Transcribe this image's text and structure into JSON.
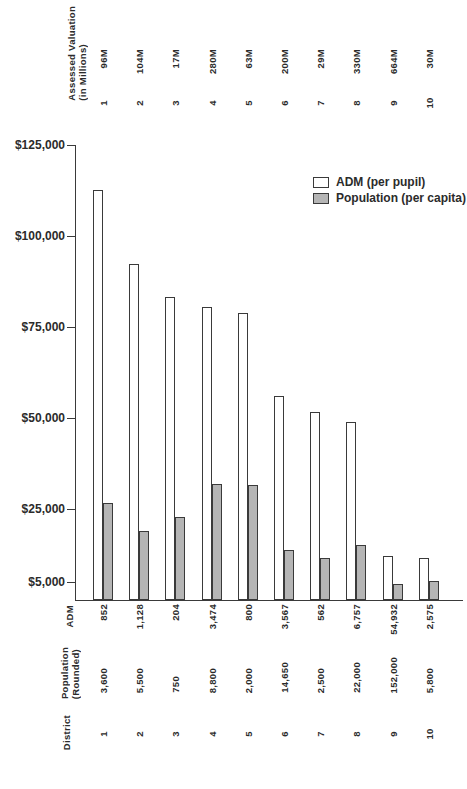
{
  "figure": {
    "top_axis": {
      "header_line1": "Assessed Valuation",
      "header_line2": "(in Millions)",
      "columns": [
        {
          "district": "1",
          "valuation": "96M"
        },
        {
          "district": "2",
          "valuation": "104M"
        },
        {
          "district": "3",
          "valuation": "17M"
        },
        {
          "district": "4",
          "valuation": "280M"
        },
        {
          "district": "5",
          "valuation": "63M"
        },
        {
          "district": "6",
          "valuation": "200M"
        },
        {
          "district": "7",
          "valuation": "29M"
        },
        {
          "district": "8",
          "valuation": "330M"
        },
        {
          "district": "9",
          "valuation": "664M"
        },
        {
          "district": "10",
          "valuation": "30M"
        }
      ]
    },
    "legend": [
      {
        "label": "ADM (per pupil)",
        "swatch": "#ffffff"
      },
      {
        "label": "Population (per capita)",
        "swatch": "#b5b5b5"
      }
    ],
    "bottom_rows": {
      "adm": {
        "header": "ADM",
        "values": [
          "852",
          "1,128",
          "204",
          "3,474",
          "800",
          "3,567",
          "562",
          "6,757",
          "54,932",
          "2,575"
        ]
      },
      "population": {
        "header_line1": "Population",
        "header_line2": "(Rounded)",
        "values": [
          "3,600",
          "5,500",
          "750",
          "8,800",
          "2,000",
          "14,650",
          "2,500",
          "22,000",
          "152,000",
          "5,800"
        ]
      },
      "district": {
        "header": "District",
        "values": [
          "1",
          "2",
          "3",
          "4",
          "5",
          "6",
          "7",
          "8",
          "9",
          "10"
        ]
      }
    }
  },
  "chart_data": {
    "type": "bar",
    "categories": [
      "1",
      "2",
      "3",
      "4",
      "5",
      "6",
      "7",
      "8",
      "9",
      "10"
    ],
    "series": [
      {
        "name": "ADM (per pupil)",
        "fill": "#ffffff",
        "values": [
          112700,
          92200,
          83300,
          80600,
          78750,
          56100,
          51600,
          48800,
          12100,
          11650
        ]
      },
      {
        "name": "Population (per capita)",
        "fill": "#b5b5b5",
        "values": [
          26700,
          18900,
          22700,
          31800,
          31500,
          13650,
          11600,
          15000,
          4370,
          5170
        ]
      }
    ],
    "y_ticks": [
      {
        "label": "$125,000",
        "value": 125000
      },
      {
        "label": "$100,000",
        "value": 100000
      },
      {
        "label": "$75,000",
        "value": 75000
      },
      {
        "label": "$50,000",
        "value": 50000
      },
      {
        "label": "$25,000",
        "value": 25000
      },
      {
        "label": "$5,000",
        "value": 5000
      }
    ],
    "ylim": [
      0,
      125000
    ],
    "grid": false,
    "legend_position": "top-right",
    "outline_color": "#3a3a3a"
  }
}
